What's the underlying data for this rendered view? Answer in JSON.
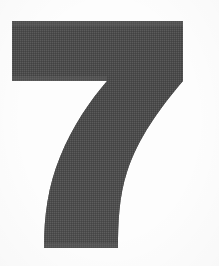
{
  "image": {
    "kind": "scanned-printed-numeral",
    "character": "7",
    "caption": "7",
    "width_px": 219,
    "height_px": 266,
    "orientation": "portrait",
    "background_color": "#fdfdfd",
    "ink_color": "#4e4e4e",
    "ink_color_dark": "#454545",
    "ink_color_light": "#5b5b5b",
    "texture": "dithered halftone screen",
    "has_text_labels": false,
    "has_border": false
  },
  "glyph": {
    "name": "digit-seven",
    "label": "7",
    "style": "bold sans-serif, flat top bar with curved tapering descender",
    "bounding_box": {
      "left": 12,
      "top": 21,
      "right": 183,
      "bottom": 249,
      "width": 171,
      "height": 228
    },
    "parts": [
      {
        "name": "top-horizontal-bar",
        "left": 12,
        "top": 21,
        "right": 183,
        "bottom": 81,
        "thickness_px": 60
      },
      {
        "name": "curved-descender-stroke",
        "top": 81,
        "bottom": 249,
        "top_left_x": 107,
        "top_right_x": 183,
        "bottom_left_x": 44,
        "bottom_right_x": 118,
        "curvature": "concave-right"
      }
    ],
    "path": "M 12 21 L 183 21 L 183 81 C 160 108 138 138 127 172 C 119 196 118 224 118 248 L 44 248 C 44 216 48 186 60 157 C 73 125 90 101 107 81 L 12 81 Z"
  },
  "margins": {
    "left_px": 12,
    "top_px": 21,
    "right_px": 36,
    "bottom_px": 17
  }
}
